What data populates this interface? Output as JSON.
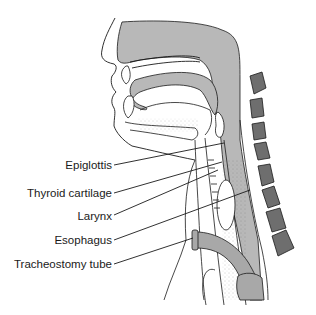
{
  "diagram": {
    "colors": {
      "background": "#ffffff",
      "soft_tissue_gray": "#b8b8b8",
      "vertebra_gray": "#6e6e6e",
      "tube_gray": "#a8a8a8",
      "outline": "#1a1a1a"
    },
    "labels": [
      {
        "id": "epiglottis",
        "text": "Epiglottis"
      },
      {
        "id": "thyroid-cartilage",
        "text": "Thyroid cartilage"
      },
      {
        "id": "larynx",
        "text": "Larynx"
      },
      {
        "id": "esophagus",
        "text": "Esophagus"
      },
      {
        "id": "tracheostomy-tube",
        "text": "Tracheostomy tube"
      }
    ]
  }
}
